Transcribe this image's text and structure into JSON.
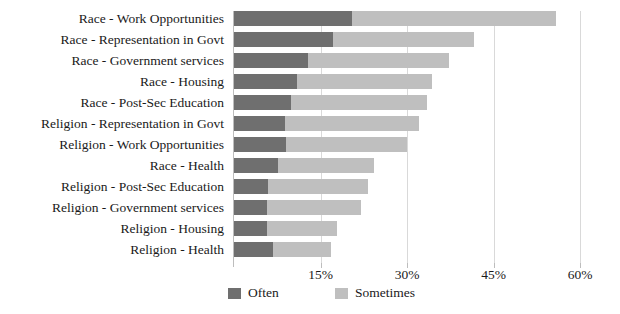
{
  "chart_data": {
    "type": "bar",
    "orientation": "horizontal",
    "stacked": true,
    "title": "",
    "subtitle": "",
    "xlabel": "",
    "ylabel": "",
    "xlim": [
      0,
      60
    ],
    "xticks": [
      "15%",
      "30%",
      "45%",
      "60%"
    ],
    "xtick_values": [
      15,
      30,
      45,
      60
    ],
    "grid": "vertical",
    "legend_position": "bottom",
    "categories": [
      "Race - Work Opportunities",
      "Race - Representation in Govt",
      "Race - Government services",
      "Race - Housing",
      "Race - Post-Sec Education",
      "Religion - Representation in Govt",
      "Religion - Work Opportunities",
      "Race - Health",
      "Religion - Post-Sec Education",
      "Religion - Government services",
      "Religion - Housing",
      "Religion - Health"
    ],
    "series": [
      {
        "name": "Often",
        "color": "#6f6f6f",
        "values": [
          20.5,
          17.1,
          12.9,
          10.9,
          9.9,
          8.9,
          9.1,
          7.7,
          5.9,
          5.7,
          5.7,
          6.7
        ]
      },
      {
        "name": "Sometimes",
        "color": "#bfbfbf",
        "values": [
          35.3,
          24.5,
          24.4,
          23.5,
          23.5,
          23.2,
          20.9,
          16.5,
          17.4,
          16.3,
          12.1,
          10.1
        ]
      }
    ],
    "totals": [
      55.8,
      41.6,
      37.3,
      34.4,
      33.4,
      32.1,
      30.0,
      24.2,
      23.3,
      22.0,
      17.8,
      16.8
    ]
  },
  "legend": {
    "items": [
      {
        "label": "Often",
        "color": "#6f6f6f"
      },
      {
        "label": "Sometimes",
        "color": "#bfbfbf"
      }
    ]
  }
}
